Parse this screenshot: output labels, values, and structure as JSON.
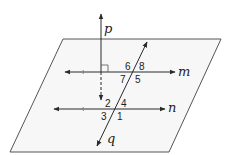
{
  "diagram": {
    "type": "geometry-plane-lines",
    "colors": {
      "line": "#2a2a2a",
      "plane_fill": "#f7f7f7",
      "plane_stroke": "#555555",
      "arrow_marker_faint": "#888888"
    },
    "lines": {
      "p": {
        "label": "p"
      },
      "m": {
        "label": "m"
      },
      "n": {
        "label": "n"
      },
      "q": {
        "label": "q"
      }
    },
    "angles_at_m": {
      "a6": "6",
      "a8": "8",
      "a7": "7",
      "a5": "5"
    },
    "angles_at_n": {
      "a2": "2",
      "a4": "4",
      "a3": "3",
      "a1": "1"
    },
    "annotations": {
      "right_angle": "p perpendicular to m",
      "parallel": "m parallel to n"
    }
  }
}
